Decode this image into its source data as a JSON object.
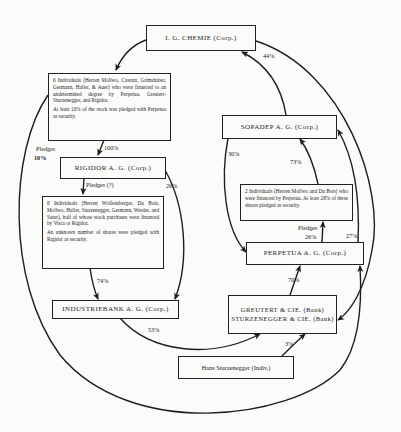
{
  "diagram": {
    "type": "ownership-flow",
    "nodes": [
      {
        "id": "igchemie",
        "label": "I. G. CHEMIE  (Corp.)"
      },
      {
        "id": "six_individuals",
        "paragraphs": [
          "6 Individuals (Herren Mollwo, Castani, Grimshaber, Germann, Haller, & Auer) who were financed to an undetermined degree by Perpetua, Greutert-Sturzenegger, and Rigidor.",
          "At least 10% of the stock was pledged with Perpetua as security."
        ]
      },
      {
        "id": "rigidor",
        "label": "RIGIDOR  A. G.  (Corp.)"
      },
      {
        "id": "eight_individuals",
        "paragraphs": [
          "8 Individuals (Herren Wolfensberger, Du Bois, Mollwo, Haller, Sturzenegger, Germann, Werder, and Suter), half of whose stock purchases were financed by Visca or Rigidor.",
          "An unknown number of shares were pledged with Rigidor as security."
        ]
      },
      {
        "id": "industriebank",
        "label": "INDUSTRIEBANK  A. G.  (Corp.)"
      },
      {
        "id": "sopadep",
        "label": "SOPADEP  A. G.  (Corp.)"
      },
      {
        "id": "two_individuals",
        "paragraphs": [
          "2 Individuals (Herren Mollwo and Du Bois) who were financed by Perpetua. At least 28% of these shares pledged as security."
        ]
      },
      {
        "id": "perpetua",
        "label": "PERPETUA  A. G.  (Corp.)"
      },
      {
        "id": "greutert",
        "label_line1": "GREUTERT & CIE.  (Bank)",
        "label_line2": "STURZENEGGER & CIE. (Bank)"
      },
      {
        "id": "hans",
        "label": "Hans Sturzenegger (Indiv.)"
      }
    ],
    "edge_labels": {
      "sopadep_to_igchemie": "44%",
      "six_to_rigidor": "100%",
      "six_pledges_perpetua_line1": "Pledges",
      "six_pledges_perpetua_line2": "10%",
      "rigidor_to_eight": "Pledges (?)",
      "rigidor_to_industriebank": "26%",
      "eight_to_industriebank": "74%",
      "industriebank_to_greutert": "53%",
      "sopadep_to_perpetua": "30%",
      "perpetua_to_sopadep": "73%",
      "two_pledges": "Pledges",
      "two_to_perpetua": "26%",
      "greutert_to_sopadep": "27%",
      "greutert_to_perpetua": "70%",
      "hans_to_greutert": "3%"
    }
  }
}
